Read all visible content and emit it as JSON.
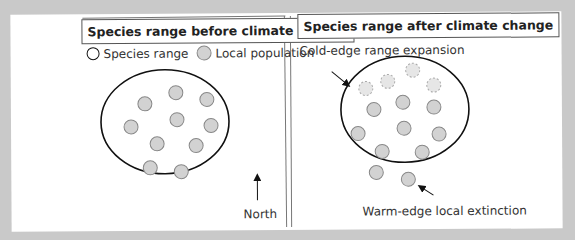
{
  "left_panel": {
    "title": "Species range before climate change",
    "legend": {
      "range_label": "Species range",
      "population_label": "Local population"
    },
    "north_label": "North",
    "range": {
      "cx": 165,
      "cy": 121,
      "rx": 64,
      "ry": 52
    },
    "populations": [
      {
        "x": 176,
        "y": 92
      },
      {
        "x": 145,
        "y": 103
      },
      {
        "x": 207,
        "y": 99
      },
      {
        "x": 131,
        "y": 126
      },
      {
        "x": 177,
        "y": 119
      },
      {
        "x": 211,
        "y": 125
      },
      {
        "x": 157,
        "y": 143
      },
      {
        "x": 196,
        "y": 145
      },
      {
        "x": 150,
        "y": 167
      },
      {
        "x": 181,
        "y": 171
      }
    ]
  },
  "right_panel": {
    "title": "Species range after climate change",
    "expansion_label": "Cold-edge range expansion",
    "extinction_label": "Warm-edge local extinction",
    "range": {
      "cx": 405,
      "cy": 110,
      "rx": 64,
      "ry": 53
    },
    "new_populations": [
      {
        "x": 413,
        "y": 71
      },
      {
        "x": 388,
        "y": 82
      },
      {
        "x": 366,
        "y": 89
      },
      {
        "x": 434,
        "y": 86
      }
    ],
    "populations": [
      {
        "x": 374,
        "y": 110
      },
      {
        "x": 403,
        "y": 103
      },
      {
        "x": 434,
        "y": 108
      },
      {
        "x": 358,
        "y": 134
      },
      {
        "x": 404,
        "y": 129
      },
      {
        "x": 439,
        "y": 135
      },
      {
        "x": 382,
        "y": 152
      },
      {
        "x": 422,
        "y": 153
      }
    ],
    "extinct_populations": [
      {
        "x": 376,
        "y": 173
      },
      {
        "x": 408,
        "y": 180
      }
    ]
  },
  "colors": {
    "background": "#c9c9c9",
    "sheet": "#ffffff",
    "population_fill": "#d2d2d2",
    "population_stroke": "#888888",
    "range_stroke": "#111111"
  }
}
